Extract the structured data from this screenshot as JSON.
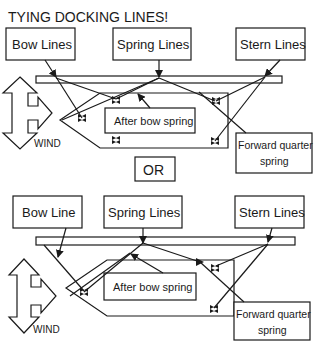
{
  "title": "TYING DOCKING LINES!",
  "separator": "OR",
  "colors": {
    "ink": "#1a1a1a",
    "background": "#ffffff"
  },
  "diagrams": [
    {
      "id": "top",
      "labels": {
        "bow": "Bow Lines",
        "spring": "Spring Lines",
        "stern": "Stern Lines",
        "after_bow_spring": "After bow spring",
        "forward_quarter_spring_1": "Forward quarter",
        "forward_quarter_spring_2": "spring",
        "wind": "WIND"
      }
    },
    {
      "id": "bottom",
      "labels": {
        "bow": "Bow Line",
        "spring": "Spring Lines",
        "stern": "Stern Lines",
        "after_bow_spring": "After bow spring",
        "forward_quarter_spring_1": "Forward quarter",
        "forward_quarter_spring_2": "spring",
        "wind": "WIND"
      }
    }
  ]
}
